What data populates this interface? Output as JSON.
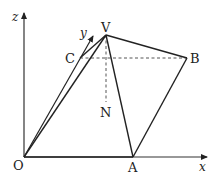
{
  "diagram": {
    "type": "pyramid-3d-coordinate",
    "axes": {
      "x_label": "x",
      "y_label": "y",
      "z_label": "z"
    },
    "points": {
      "O": {
        "label": "O",
        "px": [
          24,
          157
        ]
      },
      "A": {
        "label": "A",
        "px": [
          133,
          157
        ]
      },
      "B": {
        "label": "B",
        "px": [
          187,
          58
        ]
      },
      "C": {
        "label": "C",
        "px": [
          80,
          58
        ]
      },
      "V": {
        "label": "V",
        "px": [
          106,
          35
        ]
      },
      "N": {
        "label": "N",
        "px": [
          106,
          100
        ]
      }
    },
    "solid_edges": [
      "OA",
      "AB",
      "BV",
      "VO",
      "VA",
      "VC",
      "OC"
    ],
    "dashed_edges": [
      "CB",
      "VN"
    ],
    "colors": {
      "line": "#222222",
      "dashed": "#555555",
      "background": "#ffffff"
    }
  }
}
